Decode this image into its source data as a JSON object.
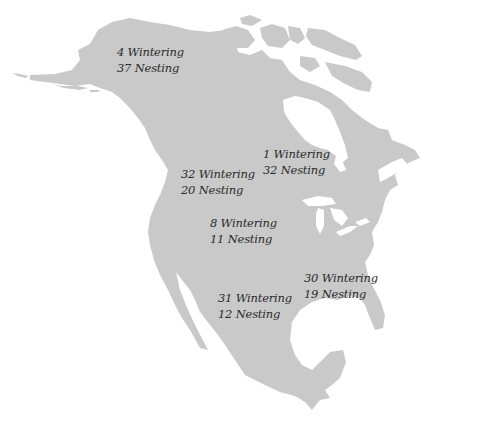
{
  "map": {
    "subject": "North America",
    "colors": {
      "land": "#c9c9c9",
      "water": "#ffffff",
      "text": "#2b2b2b"
    },
    "regions": [
      {
        "id": "alaska",
        "wintering": "4 Wintering",
        "nesting": "37 Nesting",
        "x": 117,
        "y": 44
      },
      {
        "id": "pacific-northwest",
        "wintering": "32 Wintering",
        "nesting": "20 Nesting",
        "x": 181,
        "y": 166
      },
      {
        "id": "central-canada",
        "wintering": "1 Wintering",
        "nesting": "32 Nesting",
        "x": 263,
        "y": 146
      },
      {
        "id": "great-plains",
        "wintering": "8 Wintering",
        "nesting": "11 Nesting",
        "x": 210,
        "y": 215
      },
      {
        "id": "southeast",
        "wintering": "30 Wintering",
        "nesting": "19 Nesting",
        "x": 304,
        "y": 270
      },
      {
        "id": "southwest",
        "wintering": "31 Wintering",
        "nesting": "12 Nesting",
        "x": 218,
        "y": 290
      }
    ]
  }
}
